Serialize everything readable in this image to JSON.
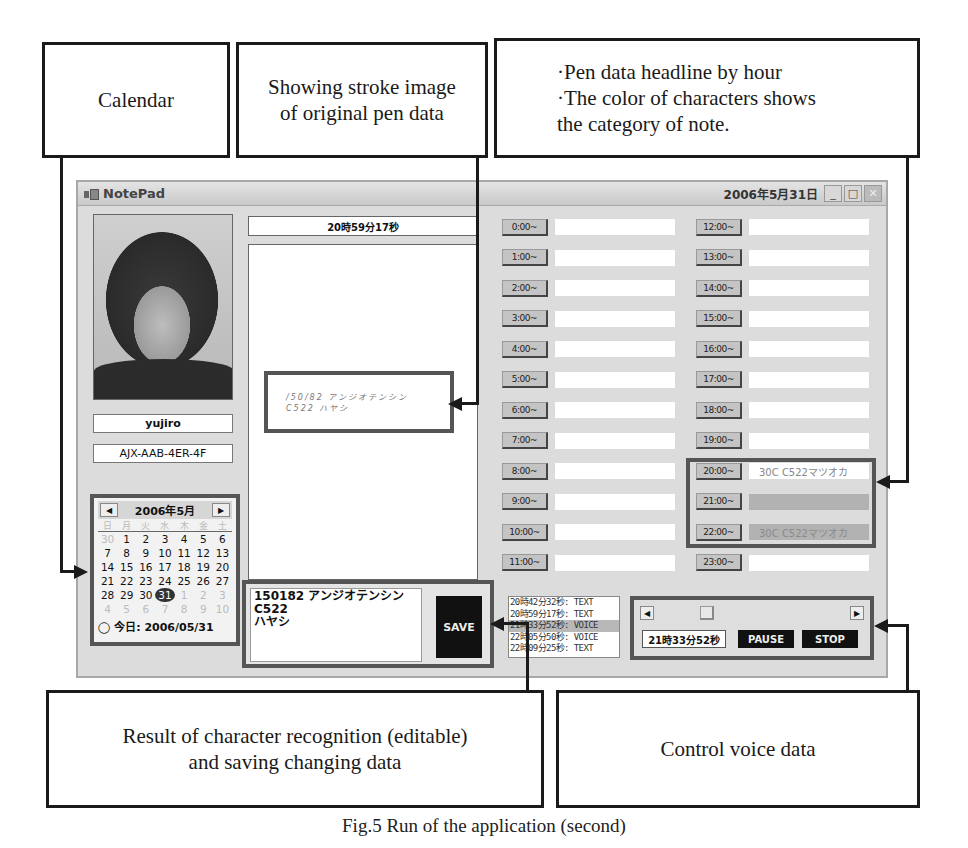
{
  "callouts": {
    "calendar": "Calendar",
    "stroke": "Showing stroke image\nof original pen data",
    "headline": "·Pen data headline by hour\n·The color of characters shows\n  the category of note.",
    "recognition": "Result of character recognition (editable)\nand saving changing data",
    "voice": "Control voice data"
  },
  "caption": "Fig.5 Run of the application (second)",
  "window": {
    "title": "NotePad",
    "date": "2006年5月31日",
    "controls": {
      "minimize": "_",
      "maximize": "□",
      "close": "✕"
    }
  },
  "user": {
    "name": "yujiro",
    "pen_id": "AJX-AAB-4ER-4F"
  },
  "calendar": {
    "title": "2006年5月",
    "prev": "◀",
    "next": "▶",
    "weekdays": [
      "日",
      "月",
      "火",
      "水",
      "木",
      "金",
      "土"
    ],
    "rows": [
      [
        "30",
        "1",
        "2",
        "3",
        "4",
        "5",
        "6"
      ],
      [
        "7",
        "8",
        "9",
        "10",
        "11",
        "12",
        "13"
      ],
      [
        "14",
        "15",
        "16",
        "17",
        "18",
        "19",
        "20"
      ],
      [
        "21",
        "22",
        "23",
        "24",
        "25",
        "26",
        "27"
      ],
      [
        "28",
        "29",
        "30",
        "31",
        "1",
        "2",
        "3"
      ],
      [
        "4",
        "5",
        "6",
        "7",
        "8",
        "9",
        "10"
      ]
    ],
    "today_label": "今日: 2006/05/31"
  },
  "stroke_view": {
    "timestamp": "20時59分17秒",
    "stroke_line1": "/50/82 アンジオテンシン",
    "stroke_line2": "C522 ハヤシ"
  },
  "recognition": {
    "text": "150182 アンジオテンシンC522\nハヤシ",
    "save_label": "SAVE"
  },
  "hours_left": [
    {
      "label": "0:00~",
      "text": ""
    },
    {
      "label": "1:00~",
      "text": ""
    },
    {
      "label": "2:00~",
      "text": ""
    },
    {
      "label": "3:00~",
      "text": ""
    },
    {
      "label": "4:00~",
      "text": ""
    },
    {
      "label": "5:00~",
      "text": ""
    },
    {
      "label": "6:00~",
      "text": ""
    },
    {
      "label": "7:00~",
      "text": ""
    },
    {
      "label": "8:00~",
      "text": ""
    },
    {
      "label": "9:00~",
      "text": ""
    },
    {
      "label": "10:00~",
      "text": ""
    },
    {
      "label": "11:00~",
      "text": ""
    }
  ],
  "hours_right": [
    {
      "label": "12:00~",
      "text": ""
    },
    {
      "label": "13:00~",
      "text": ""
    },
    {
      "label": "14:00~",
      "text": ""
    },
    {
      "label": "15:00~",
      "text": ""
    },
    {
      "label": "16:00~",
      "text": ""
    },
    {
      "label": "17:00~",
      "text": ""
    },
    {
      "label": "18:00~",
      "text": ""
    },
    {
      "label": "19:00~",
      "text": ""
    },
    {
      "label": "20:00~",
      "text": "30C C522マツオカ"
    },
    {
      "label": "21:00~",
      "text": ""
    },
    {
      "label": "22:00~",
      "text": "30C C522マツオカ"
    },
    {
      "label": "23:00~",
      "text": ""
    }
  ],
  "log": [
    "20時42分32秒: TEXT",
    "20時59分17秒: TEXT",
    "21時33分52秒: VOICE",
    "22時05分50秒: VOICE",
    "22時09分25秒: TEXT"
  ],
  "voice": {
    "scroll_left": "◀",
    "scroll_right": "▶",
    "current_time": "21時33分52秒",
    "pause_label": "PAUSE",
    "stop_label": "STOP"
  }
}
